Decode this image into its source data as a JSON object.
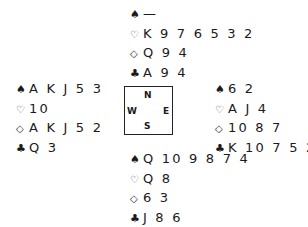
{
  "diagram": {
    "type": "bridge-deal",
    "hands": {
      "north": {
        "spades": "—",
        "hearts": "K 9 7 6 5 3 2",
        "diamonds": "Q 9 4",
        "clubs": "A 9 4"
      },
      "west": {
        "spades": "A K J 5 3",
        "hearts": "10",
        "diamonds": "A K J 5 2",
        "clubs": "Q 3"
      },
      "east": {
        "spades": "6 2",
        "hearts": "A J 4",
        "diamonds": "10 8 7",
        "clubs": "K 10 7 5 2"
      },
      "south": {
        "spades": "Q 10 9 8 7 4",
        "hearts": "Q 8",
        "diamonds": "6 3",
        "clubs": "J 8 6"
      }
    },
    "compass": {
      "n": "N",
      "s": "S",
      "e": "E",
      "w": "W"
    },
    "suit_symbols": {
      "spades": "♠",
      "hearts": "♡",
      "diamonds": "◇",
      "clubs": "♣"
    }
  }
}
